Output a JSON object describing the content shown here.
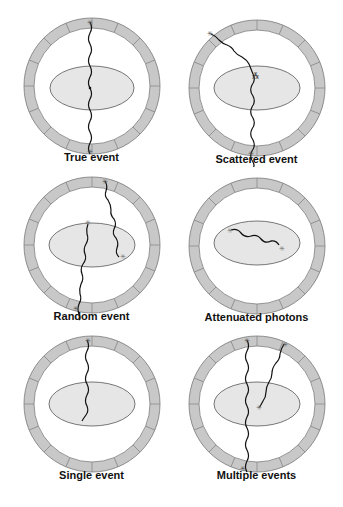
{
  "figure": {
    "colors": {
      "ring_fill": "#c8c8c8",
      "ring_stroke": "#6f6f6f",
      "object_fill": "#e6e6e6",
      "object_stroke": "#555555",
      "photon_path": "#111111",
      "background": "#ffffff"
    },
    "panels": [
      {
        "id": "true-event",
        "label": "True event",
        "description": "Two photons travel in a straight line through the object and are both detected at opposite detectors"
      },
      {
        "id": "scattered-event",
        "label": "Scattered event",
        "description": "One photon scatters inside the object, producing a mis-positioned line of response"
      },
      {
        "id": "random-event",
        "label": "Random event",
        "description": "Two unrelated annihilations each contribute one detected photon"
      },
      {
        "id": "attenuated-photons",
        "label": "Attenuated photons",
        "description": "Both photons are absorbed inside the object, no detection"
      },
      {
        "id": "single-event",
        "label": "Single event",
        "description": "Only one photon of the pair reaches the detector ring"
      },
      {
        "id": "multiple-events",
        "label": "Multiple events",
        "description": "More than two photons detected in coincidence window"
      }
    ],
    "caption_visible": false
  }
}
